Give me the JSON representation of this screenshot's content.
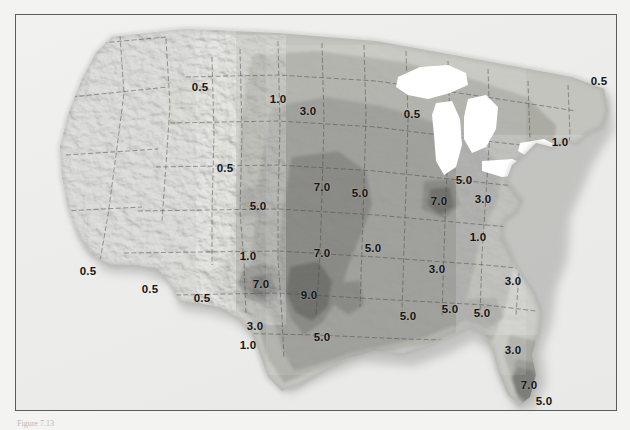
{
  "figure": {
    "domain": "thematic contour map",
    "title": "",
    "caption": "Figure 7.13",
    "frame": {
      "border_color": "#5d5d5d",
      "background": "#eeeeec"
    }
  },
  "map": {
    "region": "Contiguous United States",
    "projection_look": "shaded-relief hillshade with filled isopleth bands",
    "base_relief": true,
    "great_lakes_color": "#ffffff",
    "ocean_background": "#efefed"
  },
  "chart_data": {
    "type": "heatmap",
    "title": "",
    "xlabel": "",
    "ylabel": "",
    "legend_position": "none",
    "grid": false,
    "contour_levels": [
      0.5,
      1.0,
      3.0,
      5.0,
      7.0,
      9.0
    ],
    "level_fill_colors": [
      "#d7d7d2",
      "#c4c4be",
      "#ababa4",
      "#949490",
      "#7c7c78",
      "#5f5f5c"
    ],
    "units": "",
    "labels": [
      {
        "text": "0.5",
        "x": 184,
        "y": 72,
        "region": "Montana (west)"
      },
      {
        "text": "1.0",
        "x": 262,
        "y": 84,
        "region": "Montana (east)"
      },
      {
        "text": "3.0",
        "x": 292,
        "y": 96,
        "region": "North Dakota (west)"
      },
      {
        "text": "0.5",
        "x": 396,
        "y": 99,
        "region": "Northern Minnesota"
      },
      {
        "text": "1.0",
        "x": 544,
        "y": 127,
        "region": "New York / New England"
      },
      {
        "text": "0.5",
        "x": 583,
        "y": 66,
        "region": "Maine"
      },
      {
        "text": "0.5",
        "x": 209,
        "y": 153,
        "region": "Wyoming"
      },
      {
        "text": "5.0",
        "x": 242,
        "y": 191,
        "region": "Western Nebraska"
      },
      {
        "text": "7.0",
        "x": 306,
        "y": 172,
        "region": "Nebraska / Kansas"
      },
      {
        "text": "5.0",
        "x": 344,
        "y": 178,
        "region": "Iowa"
      },
      {
        "text": "5.0",
        "x": 448,
        "y": 165,
        "region": "Michigan (south)"
      },
      {
        "text": "7.0",
        "x": 423,
        "y": 186,
        "region": "Indiana"
      },
      {
        "text": "3.0",
        "x": 467,
        "y": 184,
        "region": "Ohio"
      },
      {
        "text": "1.0",
        "x": 462,
        "y": 222,
        "region": "Kentucky"
      },
      {
        "text": "1.0",
        "x": 232,
        "y": 241,
        "region": "Colorado (south)"
      },
      {
        "text": "7.0",
        "x": 306,
        "y": 238,
        "region": "Kansas"
      },
      {
        "text": "5.0",
        "x": 357,
        "y": 233,
        "region": "Missouri"
      },
      {
        "text": "3.0",
        "x": 421,
        "y": 254,
        "region": "Tennessee"
      },
      {
        "text": "0.5",
        "x": 72,
        "y": 256,
        "region": "Southern California"
      },
      {
        "text": "0.5",
        "x": 134,
        "y": 274,
        "region": "Arizona"
      },
      {
        "text": "0.5",
        "x": 186,
        "y": 283,
        "region": "New Mexico (west)"
      },
      {
        "text": "7.0",
        "x": 245,
        "y": 269,
        "region": "Texas Panhandle"
      },
      {
        "text": "9.0",
        "x": 293,
        "y": 280,
        "region": "Oklahoma"
      },
      {
        "text": "3.0",
        "x": 497,
        "y": 266,
        "region": "South Carolina"
      },
      {
        "text": "3.0",
        "x": 239,
        "y": 311,
        "region": "Central Texas"
      },
      {
        "text": "5.0",
        "x": 306,
        "y": 322,
        "region": "East Texas"
      },
      {
        "text": "5.0",
        "x": 392,
        "y": 301,
        "region": "Louisiana / Mississippi"
      },
      {
        "text": "5.0",
        "x": 434,
        "y": 294,
        "region": "Alabama"
      },
      {
        "text": "5.0",
        "x": 466,
        "y": 298,
        "region": "Georgia"
      },
      {
        "text": "1.0",
        "x": 232,
        "y": 330,
        "region": "South Texas"
      },
      {
        "text": "3.0",
        "x": 497,
        "y": 335,
        "region": "North Florida"
      },
      {
        "text": "7.0",
        "x": 513,
        "y": 370,
        "region": "Central Florida"
      },
      {
        "text": "5.0",
        "x": 528,
        "y": 386,
        "region": "South Florida"
      }
    ],
    "maximum": {
      "value": 9.0,
      "location": "Oklahoma / southern Kansas"
    },
    "minimum": {
      "value": 0.5,
      "location": "Western United States, Maine"
    }
  }
}
